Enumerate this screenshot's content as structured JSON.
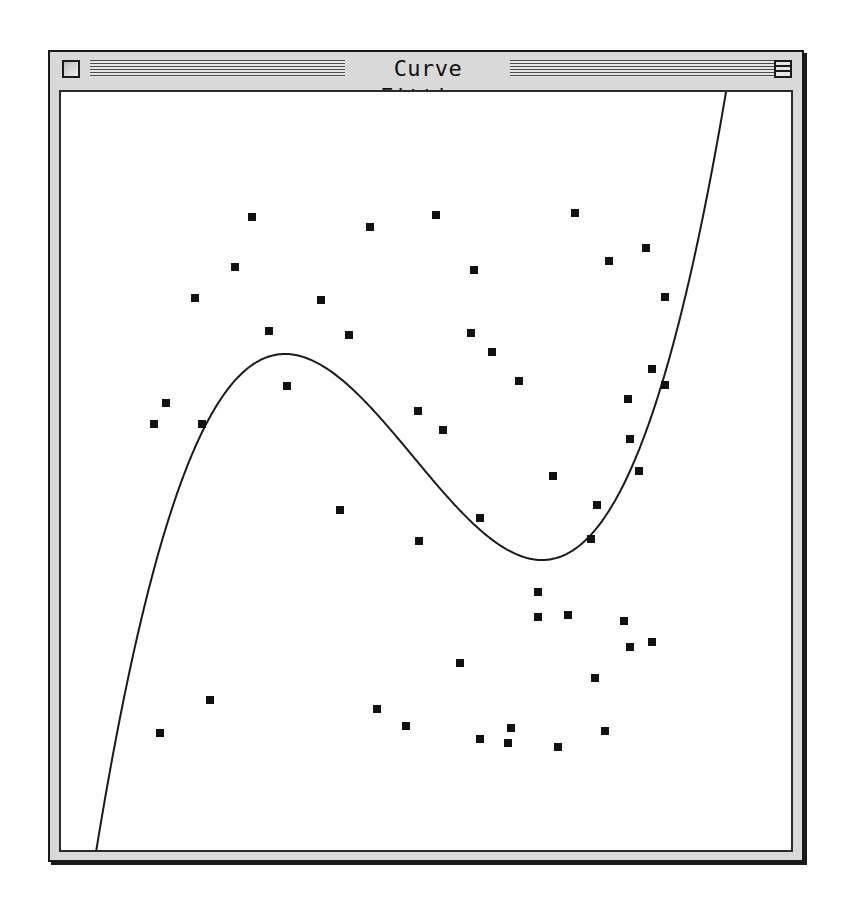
{
  "window": {
    "title": "Curve Fitting",
    "close_box": "close-box",
    "zoom_box": "zoom-box"
  },
  "colors": {
    "frame": "#d9d9d9",
    "border": "#1a1a1a",
    "content_bg": "#ffffff",
    "points": "#111111",
    "curve": "#1a1a1a"
  },
  "plot": {
    "origin_offset": [
      59,
      90
    ],
    "point_size": 8,
    "points": [
      [
        250,
        215
      ],
      [
        368,
        225
      ],
      [
        434,
        213
      ],
      [
        573,
        211
      ],
      [
        472,
        268
      ],
      [
        607,
        259
      ],
      [
        644,
        246
      ],
      [
        233,
        265
      ],
      [
        193,
        296
      ],
      [
        319,
        298
      ],
      [
        663,
        295
      ],
      [
        267,
        329
      ],
      [
        347,
        333
      ],
      [
        469,
        331
      ],
      [
        490,
        350
      ],
      [
        517,
        379
      ],
      [
        650,
        367
      ],
      [
        663,
        383
      ],
      [
        285,
        384
      ],
      [
        164,
        401
      ],
      [
        152,
        422
      ],
      [
        200,
        422
      ],
      [
        416,
        409
      ],
      [
        441,
        428
      ],
      [
        626,
        397
      ],
      [
        628,
        437
      ],
      [
        637,
        469
      ],
      [
        551,
        474
      ],
      [
        595,
        503
      ],
      [
        478,
        516
      ],
      [
        338,
        508
      ],
      [
        417,
        539
      ],
      [
        589,
        537
      ],
      [
        536,
        590
      ],
      [
        536,
        615
      ],
      [
        566,
        613
      ],
      [
        622,
        619
      ],
      [
        650,
        640
      ],
      [
        628,
        645
      ],
      [
        458,
        661
      ],
      [
        593,
        676
      ],
      [
        208,
        698
      ],
      [
        158,
        731
      ],
      [
        375,
        707
      ],
      [
        404,
        724
      ],
      [
        509,
        726
      ],
      [
        478,
        737
      ],
      [
        506,
        741
      ],
      [
        556,
        745
      ],
      [
        603,
        729
      ]
    ],
    "curve": {
      "type": "cubic",
      "start": [
        84,
        854
      ],
      "local_max": [
        283,
        352
      ],
      "local_min": [
        540,
        558
      ],
      "end": [
        731,
        91
      ]
    }
  }
}
